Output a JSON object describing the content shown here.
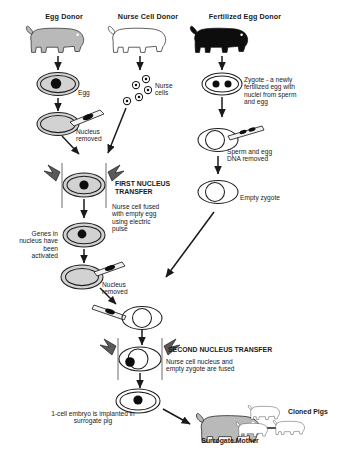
{
  "diagram": {
    "columns": [
      {
        "id": "egg-donor",
        "header": "Egg Donor",
        "pig_fill": "grey"
      },
      {
        "id": "nurse-cell-donor",
        "header": "Nurse Cell Donor",
        "pig_fill": "white"
      },
      {
        "id": "fertilized-egg-donor",
        "header": "Fertilized Egg Donor",
        "pig_fill": "black"
      }
    ],
    "labels": {
      "egg": "Egg",
      "nurse_cells": "Nurse\ncells",
      "zygote": "Zygote - a newly\nfertilized egg with\nnuclei from sperm\nand egg",
      "nucleus_removed_1": "Nucleus\nremoved",
      "sperm_egg_dna_removed": "Sperm and egg\nDNA removed",
      "empty_zygote": "Empty zygote",
      "first_transfer_title": "FIRST NUCLEUS\nTRANSFER",
      "first_transfer_body": "Nurse cell fused\nwith empty egg\nusing electric\npulse",
      "genes_activated": "Genes in\nnucleus have\nbeen\nactivated",
      "nucleus_removed_2": "Nucleus\nremoved",
      "second_transfer_title": "SECOND NUCLEUS TRANSFER",
      "second_transfer_body": "Nurse cell nucleus and\nempty zygote are fused",
      "implanted": "1-cell embryo is implanted in\nsurrogate pig",
      "surrogate_mother": "Surrogate Mother",
      "cloned_pigs": "Cloned Pigs"
    },
    "colors": {
      "ink": "#1a1a1a",
      "cell_fill": "#d2d2d2",
      "nucleus": "#0d0d0d",
      "pig_grey": "#b9b9b9",
      "pig_black": "#0d0d0d",
      "background": "#ffffff"
    },
    "nurse_cell_count": 5,
    "cloned_pig_count": 3
  }
}
